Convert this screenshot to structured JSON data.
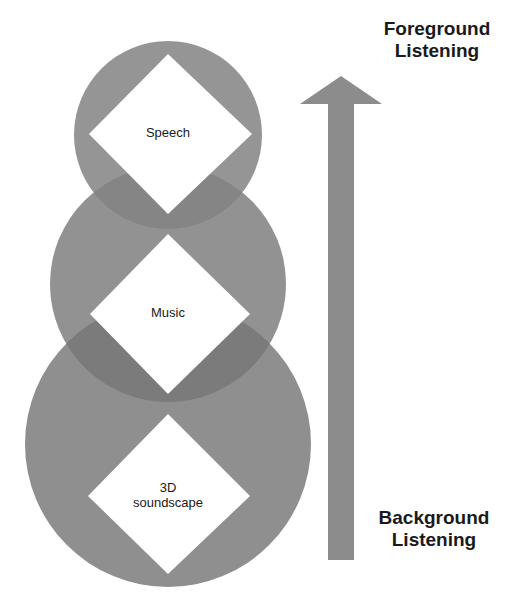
{
  "diagram": {
    "type": "layered-listening-model",
    "layers": [
      {
        "label": "Speech",
        "position": "top"
      },
      {
        "label": "Music",
        "position": "middle"
      },
      {
        "label": "3D soundscape",
        "position": "bottom",
        "lines": [
          "3D",
          "soundscape"
        ]
      }
    ],
    "arrow": {
      "direction": "up",
      "top_label": [
        "Foreground",
        "Listening"
      ],
      "bottom_label": [
        "Background",
        "Listening"
      ]
    },
    "colors": {
      "circle_fill": "#8f8f8f",
      "overlap_fill": "#7a7a7a",
      "diamond_fill": "#ffffff",
      "arrow_fill": "#8c8c8c",
      "text": "#1a1a1a"
    }
  }
}
